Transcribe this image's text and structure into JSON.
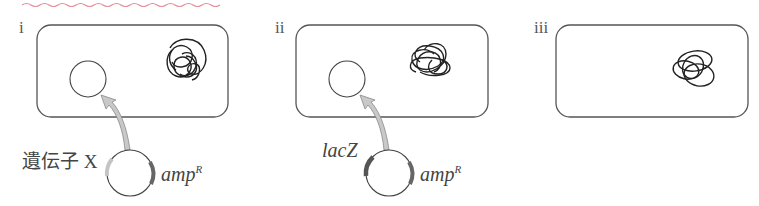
{
  "header": {
    "wavy_underline_color": "#e58a97"
  },
  "panels": [
    {
      "id": "i",
      "numeral": "i",
      "has_plasmid_in_cell": true,
      "has_chromosome": true,
      "plasmid": {
        "insert_label": "遺伝子 X",
        "insert_color": "#c4c4c4",
        "marker_label": "amp",
        "marker_sup": "R",
        "marker_color": "#666666"
      }
    },
    {
      "id": "ii",
      "numeral": "ii",
      "has_plasmid_in_cell": true,
      "has_chromosome": true,
      "plasmid": {
        "insert_label": "lacZ",
        "insert_color": "#555555",
        "marker_label": "amp",
        "marker_sup": "R",
        "marker_color": "#666666"
      }
    },
    {
      "id": "iii",
      "numeral": "iii",
      "has_plasmid_in_cell": false,
      "has_chromosome": true
    }
  ],
  "colors": {
    "outline": "#555555",
    "arrow_fill": "#c8c8c8",
    "arrow_stroke": "#8a8a8a",
    "chromosome": "#222222"
  }
}
